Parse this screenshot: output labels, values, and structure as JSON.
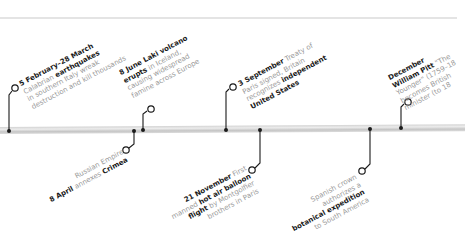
{
  "timeline": {
    "colors": {
      "bar": "#d2d2d2",
      "connector": "#1a1a1a",
      "text_muted": "#9a9a9a",
      "text_bold": "#1a1a1a"
    },
    "events_above": [
      {
        "id": "earthquakes",
        "lines": [
          [
            {
              "b": "5 February–28 March"
            }
          ],
          [
            {
              "t": "Calabrian "
            },
            {
              "b": "earthquakes"
            }
          ],
          [
            {
              "t": "in southern Italy wreak"
            }
          ],
          [
            {
              "t": "destruction and kill thousands"
            }
          ]
        ]
      },
      {
        "id": "laki",
        "lines": [
          [
            {
              "b": "8 June Laki volcano"
            }
          ],
          [
            {
              "b": "erupts"
            },
            {
              "t": " in Iceland,"
            }
          ],
          [
            {
              "t": "causing widespread"
            }
          ],
          [
            {
              "t": "famine across Europe"
            }
          ]
        ]
      },
      {
        "id": "treaty-of-paris",
        "lines": [
          [
            {
              "b": "3 September"
            },
            {
              "t": " Treaty of"
            }
          ],
          [
            {
              "t": "Paris signed, Britain"
            }
          ],
          [
            {
              "t": "recognizes "
            },
            {
              "b": "independent"
            }
          ],
          [
            {
              "b": "United States"
            }
          ]
        ]
      },
      {
        "id": "pitt",
        "lines": [
          [
            {
              "b": "December"
            }
          ],
          [
            {
              "b": "William Pitt"
            },
            {
              "t": " \"The"
            }
          ],
          [
            {
              "t": "Younger\" (1759–18"
            }
          ],
          [
            {
              "t": "becomes British"
            }
          ],
          [
            {
              "t": "minister (to 18"
            }
          ]
        ]
      }
    ],
    "events_below": [
      {
        "id": "crimea",
        "lines": [
          [
            {
              "t": "Russian Empire"
            }
          ],
          [
            {
              "b": "8 April"
            },
            {
              "t": " annexes "
            },
            {
              "b": "Crimea"
            }
          ]
        ]
      },
      {
        "id": "balloon",
        "lines": [
          [
            {
              "b": "21 November"
            },
            {
              "t": " First"
            }
          ],
          [
            {
              "t": "manned "
            },
            {
              "b": "hot air balloon"
            }
          ],
          [
            {
              "b": "flight"
            },
            {
              "t": " by Montgolfier"
            }
          ],
          [
            {
              "t": "brothers in Paris"
            }
          ]
        ]
      },
      {
        "id": "botanical",
        "lines": [
          [
            {
              "t": "Spanish crown"
            }
          ],
          [
            {
              "t": "authorizes a"
            }
          ],
          [
            {
              "b": "botanical expedition"
            }
          ],
          [
            {
              "t": "to South America"
            }
          ]
        ]
      }
    ]
  }
}
